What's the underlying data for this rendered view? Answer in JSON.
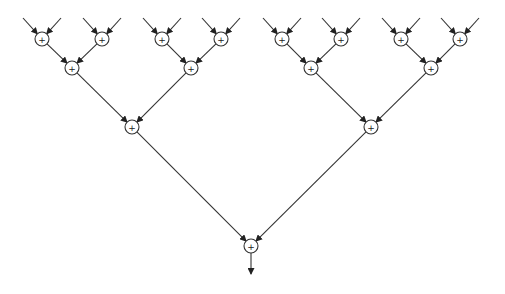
{
  "diagram": {
    "type": "binary-adder-tree",
    "node_radius": 7,
    "operator_label": "+",
    "colors": {
      "stroke": "#333333",
      "background": "#ffffff"
    },
    "nodes": [
      {
        "id": "leaf1",
        "level": 1,
        "x": 42,
        "y": 39
      },
      {
        "id": "leaf2",
        "level": 1,
        "x": 102,
        "y": 39
      },
      {
        "id": "leaf3",
        "level": 1,
        "x": 162,
        "y": 39
      },
      {
        "id": "leaf4",
        "level": 1,
        "x": 221,
        "y": 39
      },
      {
        "id": "leaf5",
        "level": 1,
        "x": 282,
        "y": 39
      },
      {
        "id": "leaf6",
        "level": 1,
        "x": 341,
        "y": 39
      },
      {
        "id": "leaf7",
        "level": 1,
        "x": 401,
        "y": 39
      },
      {
        "id": "leaf8",
        "level": 1,
        "x": 460,
        "y": 39
      },
      {
        "id": "l2a",
        "level": 2,
        "x": 72,
        "y": 68
      },
      {
        "id": "l2b",
        "level": 2,
        "x": 191,
        "y": 68
      },
      {
        "id": "l2c",
        "level": 2,
        "x": 311,
        "y": 68
      },
      {
        "id": "l2d",
        "level": 2,
        "x": 431,
        "y": 68
      },
      {
        "id": "l3a",
        "level": 3,
        "x": 132,
        "y": 127
      },
      {
        "id": "l3b",
        "level": 3,
        "x": 371,
        "y": 127
      },
      {
        "id": "root",
        "level": 4,
        "x": 251,
        "y": 246
      }
    ],
    "edges": [
      [
        "leaf1",
        "l2a"
      ],
      [
        "leaf2",
        "l2a"
      ],
      [
        "leaf3",
        "l2b"
      ],
      [
        "leaf4",
        "l2b"
      ],
      [
        "leaf5",
        "l2c"
      ],
      [
        "leaf6",
        "l2c"
      ],
      [
        "leaf7",
        "l2d"
      ],
      [
        "leaf8",
        "l2d"
      ],
      [
        "l2a",
        "l3a"
      ],
      [
        "l2b",
        "l3a"
      ],
      [
        "l2c",
        "l3b"
      ],
      [
        "l2d",
        "l3b"
      ],
      [
        "l3a",
        "root"
      ],
      [
        "l3b",
        "root"
      ]
    ],
    "input_offset": {
      "dx": 19,
      "dy": 21
    },
    "output": {
      "from": "root",
      "to_y": 274
    }
  }
}
